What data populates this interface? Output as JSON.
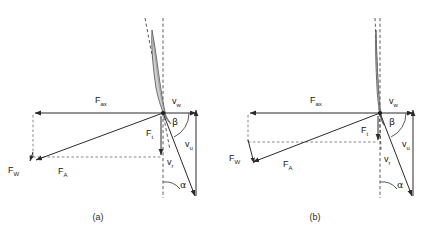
{
  "figure": {
    "type": "vector-force-velocity-diagram",
    "background_color": "#ffffff",
    "line_color": "#2a2a2a",
    "dash_color": "#4a4a4a",
    "blade_fill": "#cfcfcf"
  },
  "panels": [
    {
      "id": "a",
      "caption": "(a)",
      "blade_note": "tilted curved airfoil, large pitch",
      "labels": {
        "f_ax": "F",
        "f_ax_sub": "ax",
        "f_w": "F",
        "f_w_sub": "W",
        "f_a": "F",
        "f_a_sub": "A",
        "f_t": "F",
        "f_t_sub": "t",
        "v_w": "v",
        "v_w_sub": "w",
        "v_u": "v",
        "v_u_sub": "u",
        "v_r": "v",
        "v_r_sub": "r",
        "alpha": "α",
        "beta": "β"
      }
    },
    {
      "id": "b",
      "caption": "(b)",
      "blade_note": "near-vertical slender airfoil, small pitch",
      "labels": {
        "f_ax": "F",
        "f_ax_sub": "ax",
        "f_w": "F",
        "f_w_sub": "W",
        "f_a": "F",
        "f_a_sub": "A",
        "f_t": "F",
        "f_t_sub": "t",
        "v_w": "v",
        "v_w_sub": "w",
        "v_u": "v",
        "v_u_sub": "u",
        "v_r": "v",
        "v_r_sub": "r",
        "alpha": "α",
        "beta": "β"
      }
    }
  ],
  "legend_terms": {
    "F_ax": "axial force",
    "F_W": "resultant / weight-side force",
    "F_A": "aerodynamic force",
    "F_t": "tangential force",
    "v_w": "wind velocity",
    "v_u": "circumferential velocity",
    "v_r": "relative velocity",
    "alpha": "angle of attack",
    "beta": "blade / flow angle"
  }
}
